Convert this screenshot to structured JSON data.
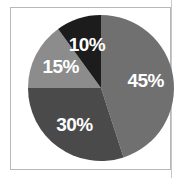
{
  "chart_data": {
    "type": "pie",
    "title": "",
    "categories": [
      "Slice A",
      "Slice B",
      "Slice C",
      "Slice D"
    ],
    "values": [
      45,
      30,
      15,
      10
    ],
    "labels": [
      "45%",
      "30%",
      "15%",
      "10%"
    ],
    "colors": [
      "#707070",
      "#4a4a4a",
      "#8c8c8c",
      "#1c1c1c"
    ],
    "start_angle": "12 o'clock, clockwise",
    "legend": "none"
  }
}
